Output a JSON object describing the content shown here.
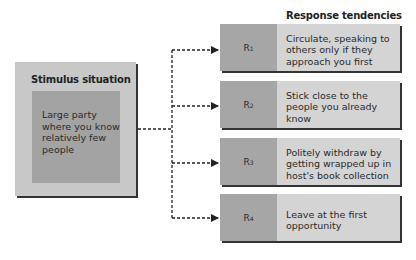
{
  "stimulus": {
    "title": "Stimulus situation",
    "description": "Large party where you know relatively few people"
  },
  "responses": {
    "heading": "Response tendencies",
    "items": [
      {
        "label": "R",
        "sub": "1",
        "text": "Circulate, speaking to others only if they approach you first"
      },
      {
        "label": "R",
        "sub": "2",
        "text": "Stick close to the people you already know"
      },
      {
        "label": "R",
        "sub": "3",
        "text": "Politely withdraw by getting wrapped up in host's book collection"
      },
      {
        "label": "R",
        "sub": "4",
        "text": "Leave at the first opportunity"
      }
    ]
  },
  "colors": {
    "outer_box": "#c8c8c8",
    "inner_box": "#a3a3a3",
    "label_cell": "#a6a6a6",
    "text_cell": "#d4d4d4",
    "shadow": "#333333",
    "connector": "#222222"
  }
}
